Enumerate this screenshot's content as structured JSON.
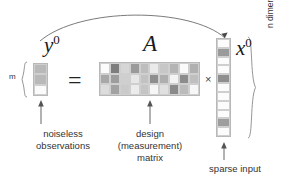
{
  "figure": {
    "kind": "compressed-sensing-equation-diagram",
    "background_color": "#ffffff",
    "stroke_color": "#555555"
  },
  "symbols": {
    "y_base": "y",
    "y_sup": "0",
    "A": "A",
    "x_base": "x",
    "x_sup": "0",
    "equals": "=",
    "times": "×",
    "m_label": "m"
  },
  "captions": {
    "noiseless": "noiseless\nobservations",
    "noiseless_line1": "noiseless",
    "noiseless_line2": "observations",
    "design_line1": "design",
    "design_line2": "(measurement)",
    "design_line3": "matrix",
    "sparse_input": "sparse input",
    "dimensions": "n dimensions, k nonzeros"
  },
  "palette": {
    "white": "#ffffff",
    "very_light": "#f2f2f2",
    "light": "#e3e3e3",
    "light_mid": "#d2d2d2",
    "mid": "#bcbcbc",
    "mid_dark": "#a6a6a6",
    "dark": "#8f8f8f",
    "darker": "#7a7a7a",
    "grid_line": "#c9c9c9",
    "border": "#b4b4b4",
    "text": "#333333",
    "arrow": "#555555"
  },
  "y_vector": {
    "rows": 3,
    "cols": 1,
    "cells": [
      "#b9b9b9",
      "#b9b9b9",
      "#fbfbfb"
    ]
  },
  "a_matrix": {
    "rows": 3,
    "cols": 10,
    "cells": [
      [
        "#fbfbfb",
        "#7d7d7d",
        "#d6d6d6",
        "#9a9a9a",
        "#bdbdbd",
        "#eaeaea",
        "#c7c7c7",
        "#b4b4b4",
        "#fafafa",
        "#b0b0b0"
      ],
      [
        "#a8a8a8",
        "#9d9d9d",
        "#cfcfcf",
        "#e7e7e7",
        "#c2c2c2",
        "#8e8e8e",
        "#aeaeae",
        "#f4f4f4",
        "#8c8c8c",
        "#bfbfbf"
      ],
      [
        "#dcdcdc",
        "#a2a2a2",
        "#cacaca",
        "#ececec",
        "#c5c5c5",
        "#f6f6f6",
        "#e0e0e0",
        "#8a8a8a",
        "#bbbbbb",
        "#f7f7f7"
      ]
    ]
  },
  "x_vector": {
    "rows": 11,
    "cols": 1,
    "cells": [
      "#fcfcfc",
      "#9a9a9a",
      "#fcfcfc",
      "#fcfcfc",
      "#8f8f8f",
      "#fcfcfc",
      "#fcfcfc",
      "#fcfcfc",
      "#fcfcfc",
      "#9e9e9e",
      "#fcfcfc"
    ],
    "nonzero_indices": [
      1,
      4,
      9
    ]
  },
  "annotations": {
    "arc_from": "x0-vector-top",
    "arc_to": "y0-vector-top",
    "arrow_noiseless": "points-up-to-y0-vector",
    "arrow_design": "points-up-to-A-matrix",
    "arrow_sparse": "points-up-to-x0-vector",
    "brace_left_label": "m",
    "brace_right_label": "n dimensions, k nonzeros"
  }
}
